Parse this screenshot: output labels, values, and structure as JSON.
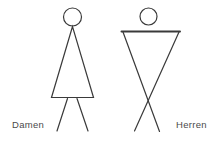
{
  "page": {
    "background": "#ffffff",
    "description_colors": {
      "line": "#3a3a3a",
      "label_text": "#4a4a4a"
    }
  },
  "symbols": {
    "women": {
      "label": "Damen",
      "icon": "women-restroom-icon"
    },
    "men": {
      "label": "Herren",
      "icon": "men-restroom-icon"
    }
  }
}
